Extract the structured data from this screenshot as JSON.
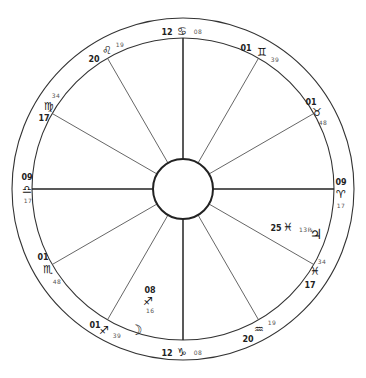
{
  "chart": {
    "type": "natal-wheel",
    "center": [
      183,
      189
    ],
    "outer_radius": 171,
    "inner_radius": 151,
    "hub_radius": 30
  },
  "cusps": [
    {
      "house": 1,
      "deg": "09",
      "sign": "♈",
      "sign_name": "aries-icon",
      "min": "17",
      "angle": 0,
      "deg_pos": [
        341,
        182
      ],
      "sign_pos": [
        341,
        195
      ],
      "min_pos": [
        341,
        206
      ],
      "major": true
    },
    {
      "house": 2,
      "deg": "17",
      "sign": "♓",
      "sign_name": "pisces-icon",
      "min": "34",
      "angle": 30,
      "deg_pos": [
        310,
        285
      ],
      "sign_pos": [
        315,
        272
      ],
      "min_pos": [
        322,
        262
      ],
      "major": false
    },
    {
      "house": 3,
      "deg": "20",
      "sign": "♒",
      "sign_name": "aquarius-icon",
      "min": "19",
      "angle": 60,
      "deg_pos": [
        248,
        339
      ],
      "sign_pos": [
        259,
        330
      ],
      "min_pos": [
        272,
        323
      ],
      "major": false
    },
    {
      "house": 4,
      "deg": "12",
      "sign": "♑",
      "sign_name": "capricorn-icon",
      "min": "08",
      "angle": 90,
      "deg_pos": [
        167,
        353
      ],
      "sign_pos": [
        182,
        353
      ],
      "min_pos": [
        198,
        353
      ],
      "major": true
    },
    {
      "house": 5,
      "deg": "01",
      "sign": "♐",
      "sign_name": "sagittarius-icon",
      "min": "39",
      "angle": 120,
      "deg_pos": [
        95,
        325
      ],
      "sign_pos": [
        104,
        331
      ],
      "min_pos": [
        117,
        336
      ],
      "major": false
    },
    {
      "house": 6,
      "deg": "01",
      "sign": "♏",
      "sign_name": "scorpio-icon",
      "min": "48",
      "angle": 150,
      "deg_pos": [
        43,
        257
      ],
      "sign_pos": [
        48,
        270
      ],
      "min_pos": [
        57,
        282
      ],
      "major": false
    },
    {
      "house": 7,
      "deg": "09",
      "sign": "♎",
      "sign_name": "libra-icon",
      "min": "17",
      "angle": 180,
      "deg_pos": [
        27,
        177
      ],
      "sign_pos": [
        27,
        190
      ],
      "min_pos": [
        28,
        201
      ],
      "major": true
    },
    {
      "house": 8,
      "deg": "17",
      "sign": "♍",
      "sign_name": "virgo-icon",
      "min": "34",
      "angle": 210,
      "deg_pos": [
        44,
        118
      ],
      "sign_pos": [
        49,
        107
      ],
      "min_pos": [
        56,
        96
      ],
      "major": false
    },
    {
      "house": 9,
      "deg": "20",
      "sign": "♌",
      "sign_name": "leo-icon",
      "min": "19",
      "angle": 240,
      "deg_pos": [
        94,
        59
      ],
      "sign_pos": [
        107,
        51
      ],
      "min_pos": [
        120,
        45
      ],
      "major": false
    },
    {
      "house": 10,
      "deg": "12",
      "sign": "♋",
      "sign_name": "cancer-icon",
      "min": "08",
      "angle": 270,
      "deg_pos": [
        167,
        32
      ],
      "sign_pos": [
        182,
        32
      ],
      "min_pos": [
        198,
        32
      ],
      "major": true
    },
    {
      "house": 11,
      "deg": "01",
      "sign": "♊",
      "sign_name": "gemini-icon",
      "min": "39",
      "angle": 300,
      "deg_pos": [
        246,
        48
      ],
      "sign_pos": [
        262,
        53
      ],
      "min_pos": [
        275,
        60
      ],
      "major": false
    },
    {
      "house": 12,
      "deg": "01",
      "sign": "♉",
      "sign_name": "taurus-icon",
      "min": "48",
      "angle": 330,
      "deg_pos": [
        311,
        102
      ],
      "sign_pos": [
        317,
        113
      ],
      "min_pos": [
        323,
        123
      ],
      "major": false
    }
  ],
  "planets": [
    {
      "name": "jupiter",
      "glyph": "♃",
      "icon": "jupiter-icon",
      "deg": "25",
      "sign": "♓",
      "min": "13℞",
      "deg_pos": [
        276,
        228
      ],
      "sign_pos": [
        288,
        228
      ],
      "min_pos": [
        299,
        230
      ],
      "glyph_pos": [
        316,
        235
      ]
    },
    {
      "name": "moon",
      "glyph": "☽",
      "icon": "moon-icon",
      "glyph_pos": [
        136,
        331
      ]
    },
    {
      "name": "moon-degree",
      "deg": "08",
      "sign": "♐",
      "min": "16",
      "deg_pos": [
        150,
        290
      ],
      "sign_pos": [
        148,
        302
      ],
      "min_pos": [
        146,
        311
      ]
    }
  ]
}
